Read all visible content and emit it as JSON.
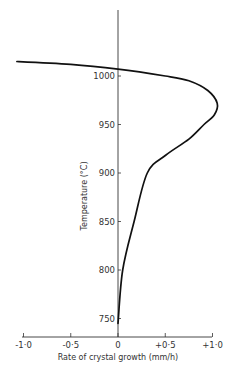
{
  "chart_data": {
    "type": "line",
    "title": "",
    "xlabel": "Rate of crystal growth (mm/h)",
    "ylabel": "Temperature (°C)",
    "xlim": [
      -1.0,
      1.0
    ],
    "ylim": [
      740,
      1030
    ],
    "x_ticks": [
      -1.0,
      -0.5,
      0,
      0.5,
      1.0
    ],
    "x_tick_labels": [
      "-1·0",
      "-0·5",
      "0",
      "+0·5",
      "+1·0"
    ],
    "y_ticks": [
      750,
      800,
      850,
      900,
      950,
      1000
    ],
    "y_tick_labels": [
      "750",
      "800",
      "850",
      "900",
      "950",
      "1000"
    ],
    "grid": false,
    "legend": null,
    "series": [
      {
        "name": "Rate of crystal growth vs temperature",
        "points": [
          {
            "x": -1.07,
            "y": 1015
          },
          {
            "x": -0.5,
            "y": 1012
          },
          {
            "x": 0.0,
            "y": 1007
          },
          {
            "x": 0.5,
            "y": 1000
          },
          {
            "x": 0.75,
            "y": 995
          },
          {
            "x": 0.95,
            "y": 985
          },
          {
            "x": 1.05,
            "y": 972
          },
          {
            "x": 1.02,
            "y": 960
          },
          {
            "x": 0.91,
            "y": 950
          },
          {
            "x": 0.75,
            "y": 935
          },
          {
            "x": 0.5,
            "y": 918
          },
          {
            "x": 0.31,
            "y": 900
          },
          {
            "x": 0.17,
            "y": 850
          },
          {
            "x": 0.05,
            "y": 800
          },
          {
            "x": 0.0,
            "y": 745
          }
        ]
      }
    ]
  }
}
